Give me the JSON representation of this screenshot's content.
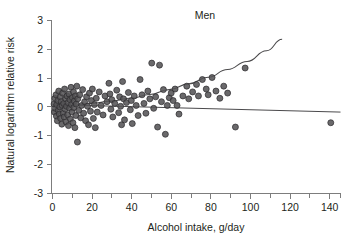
{
  "chart_data": {
    "type": "scatter",
    "title": "Men",
    "xlabel": "Alcohol intake, g/day",
    "ylabel": "Natural logarithm relative risk",
    "xlim": [
      0,
      148
    ],
    "ylim": [
      -3,
      3
    ],
    "xticks_labeled": [
      0,
      20,
      40,
      60,
      80,
      100,
      120,
      140
    ],
    "xtick_minor_step": 10,
    "yticks_labeled": [
      3,
      2,
      1,
      0,
      -1,
      -2,
      -3
    ],
    "ytick_labels": [
      "3",
      "2",
      "1",
      "0",
      "-1",
      "-2",
      "-3"
    ],
    "grid": false,
    "legend": "none",
    "marker_color": "#555456",
    "marker_edge_color": "#2b2a2c",
    "curve_color": "#4b4a4c",
    "axis_color": "#7d7d7d",
    "series": [
      {
        "name": "Studies",
        "points": [
          [
            0.8,
            0.1
          ],
          [
            1.0,
            -0.18
          ],
          [
            1.2,
            0.3
          ],
          [
            1.5,
            -0.05
          ],
          [
            1.8,
            0.42
          ],
          [
            2.0,
            -0.32
          ],
          [
            2.2,
            0.08
          ],
          [
            2.5,
            -0.48
          ],
          [
            2.8,
            0.22
          ],
          [
            3.0,
            -0.12
          ],
          [
            3.2,
            0.55
          ],
          [
            3.5,
            -0.25
          ],
          [
            3.8,
            0.0
          ],
          [
            4.0,
            0.35
          ],
          [
            4.2,
            -0.4
          ],
          [
            4.5,
            0.18
          ],
          [
            4.8,
            -0.6
          ],
          [
            5.0,
            0.05
          ],
          [
            5.2,
            0.48
          ],
          [
            5.5,
            -0.22
          ],
          [
            5.8,
            0.12
          ],
          [
            6.0,
            -0.35
          ],
          [
            6.2,
            0.62
          ],
          [
            6.5,
            -0.08
          ],
          [
            6.8,
            0.28
          ],
          [
            7.0,
            -0.52
          ],
          [
            7.2,
            0.02
          ],
          [
            7.5,
            0.38
          ],
          [
            7.8,
            -0.28
          ],
          [
            8.0,
            0.15
          ],
          [
            8.2,
            -0.65
          ],
          [
            8.5,
            0.45
          ],
          [
            8.8,
            -0.05
          ],
          [
            9.0,
            0.25
          ],
          [
            9.2,
            -0.42
          ],
          [
            9.5,
            0.68
          ],
          [
            9.8,
            0.08
          ],
          [
            10.0,
            -0.18
          ],
          [
            10.2,
            0.32
          ],
          [
            10.5,
            -0.55
          ],
          [
            10.8,
            0.52
          ],
          [
            11.0,
            -0.02
          ],
          [
            11.2,
            0.2
          ],
          [
            11.5,
            -0.72
          ],
          [
            11.8,
            0.38
          ],
          [
            12.0,
            -0.3
          ],
          [
            12.2,
            0.1
          ],
          [
            12.5,
            0.72
          ],
          [
            12.8,
            -1.22
          ],
          [
            13.0,
            0.28
          ],
          [
            13.5,
            -0.12
          ],
          [
            14.0,
            0.42
          ],
          [
            14.5,
            -0.38
          ],
          [
            15.0,
            0.05
          ],
          [
            15.5,
            0.6
          ],
          [
            16.0,
            -0.22
          ],
          [
            16.5,
            0.18
          ],
          [
            17.0,
            -0.48
          ],
          [
            17.5,
            0.35
          ],
          [
            18.0,
            0.02
          ],
          [
            18.5,
            -0.62
          ],
          [
            19.0,
            0.48
          ],
          [
            19.5,
            -0.15
          ],
          [
            20.0,
            0.22
          ],
          [
            20.5,
            0.62
          ],
          [
            21.0,
            -0.4
          ],
          [
            21.5,
            0.08
          ],
          [
            22.0,
            -0.72
          ],
          [
            22.5,
            0.3
          ],
          [
            23.0,
            -0.18
          ],
          [
            24.0,
            0.52
          ],
          [
            25.0,
            0.05
          ],
          [
            26.0,
            -0.28
          ],
          [
            27.0,
            0.38
          ],
          [
            28.0,
            0.18
          ],
          [
            29.0,
            0.82
          ],
          [
            29.5,
            0.45
          ],
          [
            30.0,
            -0.08
          ],
          [
            30.5,
            0.25
          ],
          [
            31.0,
            -0.35
          ],
          [
            32.0,
            0.12
          ],
          [
            33.0,
            0.58
          ],
          [
            34.0,
            -0.2
          ],
          [
            34.5,
            0.35
          ],
          [
            35.0,
            0.02
          ],
          [
            35.5,
            -0.62
          ],
          [
            36.0,
            0.88
          ],
          [
            36.5,
            0.28
          ],
          [
            37.0,
            -0.45
          ],
          [
            38.0,
            0.15
          ],
          [
            39.0,
            0.5
          ],
          [
            40.0,
            -0.1
          ],
          [
            40.5,
            0.22
          ],
          [
            41.0,
            -0.58
          ],
          [
            42.0,
            0.38
          ],
          [
            43.0,
            0.05
          ],
          [
            44.0,
            -0.3
          ],
          [
            45.0,
            0.95
          ],
          [
            46.0,
            0.42
          ],
          [
            47.0,
            0.12
          ],
          [
            48.0,
            -0.22
          ],
          [
            49.0,
            0.55
          ],
          [
            50.0,
            0.28
          ],
          [
            51.0,
            1.52
          ],
          [
            52.0,
            -0.05
          ],
          [
            53.0,
            0.35
          ],
          [
            54.0,
            -0.7
          ],
          [
            55.0,
            1.45
          ],
          [
            56.0,
            0.18
          ],
          [
            57.0,
            0.6
          ],
          [
            58.0,
            -0.95
          ],
          [
            59.0,
            0.05
          ],
          [
            60.0,
            0.32
          ],
          [
            61.0,
            0.48
          ],
          [
            62.0,
            0.22
          ],
          [
            63.0,
            0.62
          ],
          [
            64.0,
            0.05
          ],
          [
            65.0,
            -0.25
          ],
          [
            67.0,
            0.38
          ],
          [
            69.0,
            0.72
          ],
          [
            70.0,
            0.28
          ],
          [
            72.0,
            0.52
          ],
          [
            74.0,
            0.78
          ],
          [
            75.0,
            0.38
          ],
          [
            77.0,
            0.95
          ],
          [
            79.0,
            0.62
          ],
          [
            80.0,
            0.42
          ],
          [
            82.0,
            1.02
          ],
          [
            84.0,
            0.55
          ],
          [
            86.0,
            0.3
          ],
          [
            88.0,
            0.72
          ],
          [
            90.0,
            0.48
          ],
          [
            94.0,
            -0.7
          ],
          [
            99.0,
            1.35
          ],
          [
            143.0,
            -0.55
          ]
        ]
      }
    ],
    "fit_curve": {
      "name": "Fitted dose-response curve",
      "points": [
        [
          0,
          0.02
        ],
        [
          10,
          0.06
        ],
        [
          20,
          0.12
        ],
        [
          30,
          0.2
        ],
        [
          40,
          0.3
        ],
        [
          50,
          0.43
        ],
        [
          60,
          0.6
        ],
        [
          70,
          0.8
        ],
        [
          80,
          1.03
        ],
        [
          90,
          1.3
        ],
        [
          100,
          1.58
        ],
        [
          110,
          1.95
        ],
        [
          118,
          2.35
        ]
      ]
    },
    "reference_line": {
      "name": "Near-zero reference line",
      "y_start": 0.08,
      "y_end": -0.18,
      "x_start": 0,
      "x_end": 148
    }
  }
}
